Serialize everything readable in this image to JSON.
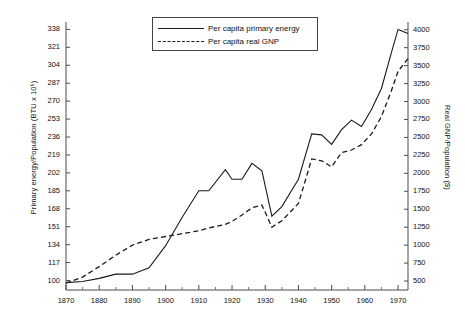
{
  "chart_data": {
    "type": "line",
    "title": "",
    "xlabel": "",
    "ylabel": "Primary energy/Population (BTU x 10⁶)",
    "ylabel_right": "Real GNP/Population ($)",
    "xlim": [
      1870,
      1973
    ],
    "ylim": [
      91,
      345
    ],
    "ylim_right": [
      375,
      4108
    ],
    "grid": false,
    "legend_position": "top-center",
    "xticks": [
      1870,
      1880,
      1890,
      1900,
      1910,
      1920,
      1930,
      1940,
      1950,
      1960,
      1970
    ],
    "xminor_ticks": [
      1875,
      1885,
      1895,
      1905,
      1915,
      1925,
      1935,
      1945,
      1955,
      1965
    ],
    "yticks_left": [
      100,
      117,
      134,
      151,
      168,
      185,
      202,
      219,
      236,
      253,
      270,
      287,
      304,
      321,
      338
    ],
    "yticks_right": [
      500,
      750,
      1000,
      1250,
      1500,
      1750,
      2000,
      2250,
      2500,
      2750,
      3000,
      3250,
      3500,
      3750,
      4000
    ],
    "series": [
      {
        "name": "Per capita primary energy",
        "style": "solid",
        "color": "#1a1a1a",
        "axis": "left",
        "x": [
          1870,
          1875,
          1880,
          1885,
          1890,
          1895,
          1900,
          1905,
          1910,
          1913,
          1918,
          1920,
          1923,
          1926,
          1929,
          1932,
          1935,
          1940,
          1944,
          1947,
          1950,
          1953,
          1956,
          1959,
          1962,
          1965,
          1968,
          1970,
          1973
        ],
        "values": [
          98,
          99,
          102,
          106,
          106,
          112,
          133,
          160,
          185,
          185,
          205,
          196,
          196,
          211,
          204,
          161,
          170,
          196,
          239,
          238,
          229,
          243,
          252,
          246,
          262,
          282,
          316,
          338,
          334
        ]
      },
      {
        "name": "Per capita real GNP",
        "style": "dashed",
        "color": "#1a1a1a",
        "axis": "right",
        "x": [
          1870,
          1875,
          1880,
          1885,
          1890,
          1895,
          1900,
          1905,
          1910,
          1913,
          1918,
          1920,
          1923,
          1926,
          1929,
          1932,
          1935,
          1940,
          1944,
          1947,
          1950,
          1953,
          1956,
          1959,
          1962,
          1965,
          1968,
          1970,
          1973
        ],
        "values": [
          470,
          555,
          700,
          860,
          1000,
          1080,
          1120,
          1160,
          1200,
          1240,
          1290,
          1330,
          1420,
          1520,
          1560,
          1250,
          1340,
          1580,
          2200,
          2175,
          2090,
          2290,
          2325,
          2400,
          2550,
          2790,
          3150,
          3420,
          3600
        ]
      }
    ]
  },
  "legend": {
    "entries": [
      {
        "label": "Per capita primary energy",
        "style": "solid"
      },
      {
        "label": "Per capita real GNP",
        "style": "dashed"
      }
    ]
  }
}
